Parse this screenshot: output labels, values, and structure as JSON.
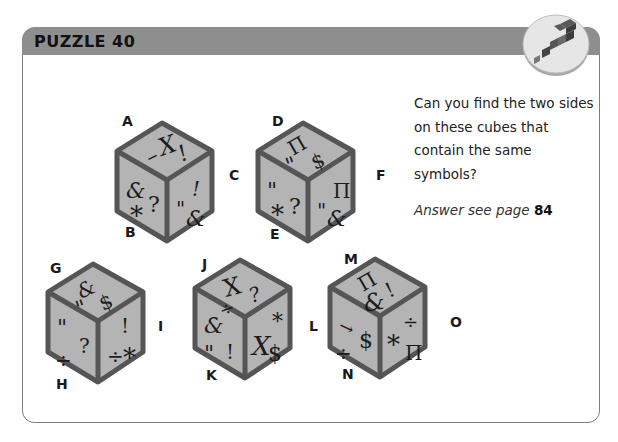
{
  "header": {
    "title": "PUZZLE 40",
    "badge_icon": "question-mark-blocks-icon",
    "bar_color": "#8e8e8e"
  },
  "question": {
    "text": "Can you find the two sides on these cubes that contain the same symbols?",
    "answer_prefix": "Answer see page",
    "answer_page": "84"
  },
  "cubes": [
    {
      "id": "cube-1",
      "labels": {
        "top": "A",
        "left": "B",
        "right": "C"
      },
      "faces": {
        "top": [
          "–",
          "X",
          "!"
        ],
        "left": [
          "&",
          "?",
          "*"
        ],
        "right": [
          "!",
          "\"",
          "&"
        ]
      }
    },
    {
      "id": "cube-2",
      "labels": {
        "top": "D",
        "left": "E",
        "right": "F"
      },
      "faces": {
        "top": [
          "Π",
          "$",
          "\""
        ],
        "left": [
          "\"",
          "*",
          "?"
        ],
        "right": [
          "Π",
          "\"",
          "&"
        ]
      }
    },
    {
      "id": "cube-3",
      "labels": {
        "top": "G",
        "left": "H",
        "right": "I"
      },
      "faces": {
        "top": [
          "&",
          "\"",
          "$"
        ],
        "left": [
          "\"",
          "?",
          "÷"
        ],
        "right": [
          "!",
          "÷",
          "*"
        ]
      }
    },
    {
      "id": "cube-4",
      "labels": {
        "top": "J",
        "left": "K",
        "right": "L"
      },
      "faces": {
        "top": [
          "X",
          "?",
          "÷"
        ],
        "left": [
          "&",
          "\"",
          "!"
        ],
        "right": [
          "X",
          "*",
          "$"
        ]
      }
    },
    {
      "id": "cube-5",
      "labels": {
        "top": "M",
        "left": "N",
        "right": "O"
      },
      "faces": {
        "top": [
          "Π",
          "!",
          "&"
        ],
        "left": [
          "→",
          "$",
          "÷"
        ],
        "right": [
          "÷",
          "*",
          "Π"
        ]
      }
    }
  ],
  "colors": {
    "cube_face": "#b4b4b4",
    "cube_edge": "#555555",
    "frame_border": "#7d7d7d"
  }
}
